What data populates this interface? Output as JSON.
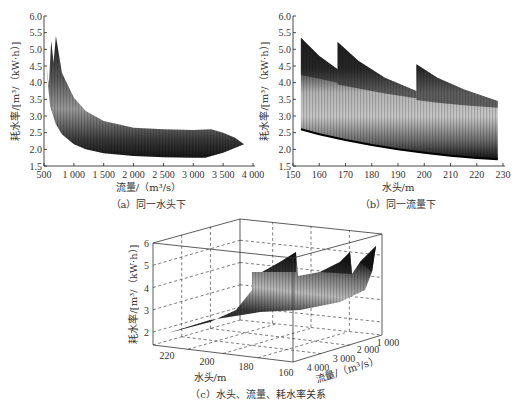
{
  "chart_data": [
    {
      "id": "a",
      "type": "area",
      "title": "（a）同一水头下",
      "xlabel": "流量/（m³/s）",
      "ylabel": "耗水率/[m³/（kW·h）]",
      "xlim": [
        500,
        4000
      ],
      "ylim": [
        1.5,
        6.0
      ],
      "xticks": [
        "500",
        "1 000",
        "1 500",
        "2 000",
        "2 500",
        "3 000",
        "3 500",
        "4 000"
      ],
      "xtick_values": [
        500,
        1000,
        1500,
        2000,
        2500,
        3000,
        3500,
        4000
      ],
      "yticks": [
        "1.5",
        "2.0",
        "2.5",
        "3.0",
        "3.5",
        "4.0",
        "4.5",
        "5.0",
        "5.5",
        "6.0"
      ],
      "ytick_values": [
        1.5,
        2.0,
        2.5,
        3.0,
        3.5,
        4.0,
        4.5,
        5.0,
        5.5,
        6.0
      ],
      "grid": false,
      "description": "Family of water-consumption-rate curves vs. discharge at fixed head, rendered as a shaded surface band",
      "series": [
        {
          "name": "upper envelope",
          "x": [
            540,
            580,
            620,
            660,
            700,
            800,
            1000,
            1200,
            1500,
            2000,
            2500,
            3000,
            3300,
            3500,
            3700,
            3850
          ],
          "y": [
            4.55,
            3.9,
            5.25,
            4.6,
            5.4,
            4.3,
            3.55,
            3.15,
            2.85,
            2.65,
            2.6,
            2.58,
            2.6,
            2.5,
            2.35,
            2.15
          ]
        },
        {
          "name": "lower envelope",
          "x": [
            540,
            600,
            700,
            800,
            1000,
            1200,
            1500,
            2000,
            2500,
            3000,
            3200,
            3500,
            3850
          ],
          "y": [
            4.55,
            3.3,
            2.75,
            2.45,
            2.15,
            2.0,
            1.88,
            1.8,
            1.76,
            1.75,
            1.75,
            1.9,
            2.15
          ]
        }
      ]
    },
    {
      "id": "b",
      "type": "area",
      "title": "（b）同一流量下",
      "xlabel": "水头/m",
      "ylabel": "耗水率/[m³/（kW·h）]",
      "xlim": [
        150,
        230
      ],
      "ylim": [
        1.5,
        6.0
      ],
      "xticks": [
        "150",
        "160",
        "170",
        "180",
        "190",
        "200",
        "210",
        "220",
        "230"
      ],
      "xtick_values": [
        150,
        160,
        170,
        180,
        190,
        200,
        210,
        220,
        230
      ],
      "yticks": [
        "1.5",
        "2.0",
        "2.5",
        "3.0",
        "3.5",
        "4.0",
        "4.5",
        "5.0",
        "5.5",
        "6.0"
      ],
      "ytick_values": [
        1.5,
        2.0,
        2.5,
        3.0,
        3.5,
        4.0,
        4.5,
        5.0,
        5.5,
        6.0
      ],
      "grid": false,
      "description": "Family of water-consumption-rate curves vs. head at fixed discharge, rendered as shaded band with three sawtooth upper segments",
      "series": [
        {
          "name": "upper segment 1",
          "x": [
            153,
            160,
            167
          ],
          "y": [
            5.35,
            4.8,
            4.4
          ]
        },
        {
          "name": "upper segment 2",
          "x": [
            167,
            175,
            185,
            197
          ],
          "y": [
            5.22,
            4.65,
            4.15,
            3.75
          ]
        },
        {
          "name": "upper segment 3",
          "x": [
            197,
            205,
            215,
            228
          ],
          "y": [
            4.55,
            4.15,
            3.8,
            3.45
          ]
        },
        {
          "name": "mid band top",
          "x": [
            153,
            170,
            190,
            210,
            228
          ],
          "y": [
            3.78,
            3.5,
            3.2,
            3.0,
            2.9
          ]
        },
        {
          "name": "lower envelope",
          "x": [
            153,
            160,
            170,
            180,
            190,
            200,
            210,
            220,
            228
          ],
          "y": [
            2.6,
            2.45,
            2.28,
            2.13,
            2.0,
            1.9,
            1.81,
            1.74,
            1.7
          ]
        }
      ]
    },
    {
      "id": "c",
      "type": "surface3d",
      "title": "（c）水头、流量、耗水率关系",
      "xlabel": "水头/m",
      "ylabel": "流量/（m³/s）",
      "zlabel": "耗水率/[m³/（kW·h）]",
      "xticks": [
        "220",
        "200",
        "180",
        "160"
      ],
      "yticks": [
        "4 000",
        "3 000",
        "2 000",
        "1 000"
      ],
      "zticks": [
        "2",
        "3",
        "4",
        "5",
        "6"
      ],
      "zlim": [
        1.5,
        6
      ],
      "grid": true,
      "description": "3D surface of water consumption rate over head and discharge; rises steeply toward low discharge, with sawtooth peaks ~5.2–5.4"
    }
  ]
}
